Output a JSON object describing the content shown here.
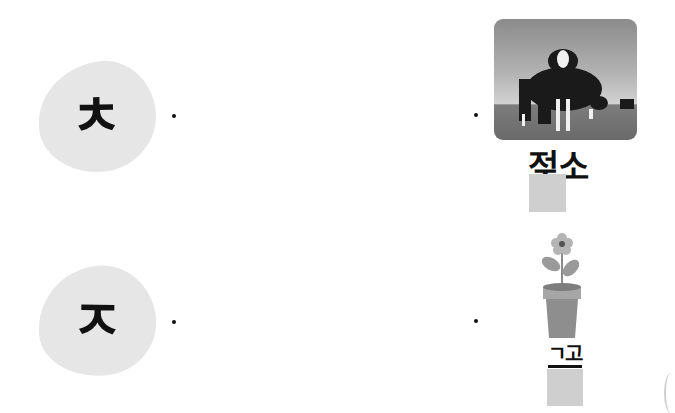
{
  "worksheet": {
    "rows": [
      {
        "consonant": "ㅊ",
        "picture": "cow-photo",
        "word_visible": "젖소",
        "word_masked_part": "ㅈ",
        "left_dot": [
          174,
          116
        ],
        "right_dot": [
          476,
          115
        ]
      },
      {
        "consonant": "ㅈ",
        "picture": "flowerpot-illustration",
        "word_visible": "ㄱ고",
        "left_dot": [
          174,
          322
        ],
        "right_dot": [
          476,
          321
        ]
      }
    ]
  },
  "colors": {
    "blob": "#e6e6e6",
    "mask": "#cfcfcf",
    "text": "#111111"
  }
}
